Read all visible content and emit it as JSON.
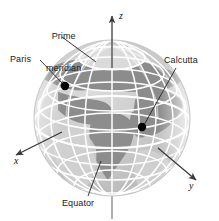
{
  "figure": {
    "background_color": "#ffffff"
  },
  "labels": {
    "prime_meridian_line1": "Prime",
    "prime_meridian_line2": "meridian",
    "paris": "Paris",
    "calcutta": "Calcutta",
    "equator": "Equator"
  },
  "axes": {
    "x_label": "x",
    "y_label": "y",
    "z_label": "z"
  },
  "colors": {
    "ocean": "#c9c9c9",
    "land": "#8d8d8d",
    "gridline": "#ffffff",
    "polar_cap": "#d8d8d8",
    "marker": "#000000",
    "leader": "#222222",
    "axis": "#555555",
    "text": "#1a1a1a"
  },
  "markers": [
    {
      "name": "paris",
      "x": 65,
      "y": 86
    },
    {
      "name": "calcutta",
      "x": 142,
      "y": 127
    }
  ],
  "globe": {
    "center_x": 112,
    "center_y": 118,
    "radius": 78,
    "latitude_count": 9,
    "longitude_count": 12
  }
}
